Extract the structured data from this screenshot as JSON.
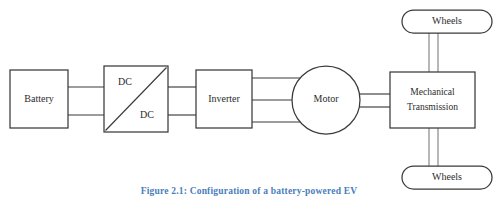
{
  "figure": {
    "caption": "Figure 2.1: Configuration of a battery-powered EV",
    "caption_color": "#4a7ebb",
    "background_color": "#ffffff",
    "stroke_color": "#3a3a3a",
    "shaft_color": "#7d7d84"
  },
  "nodes": {
    "battery": {
      "label": "Battery",
      "shape": "rectangle"
    },
    "dcdc": {
      "label_top": "DC",
      "label_bottom": "DC",
      "shape": "rectangle-with-diagonal"
    },
    "inverter": {
      "label": "Inverter",
      "shape": "rectangle"
    },
    "motor": {
      "label": "Motor",
      "shape": "circle"
    },
    "transmission": {
      "label_line1": "Mechanical",
      "label_line2": "Transmission",
      "shape": "rectangle"
    },
    "wheels_top": {
      "label": "Wheels",
      "shape": "stadium"
    },
    "wheels_bottom": {
      "label": "Wheels",
      "shape": "stadium"
    }
  },
  "connections": [
    {
      "from": "battery",
      "to": "dcdc",
      "lines": 2,
      "kind": "dc-bus"
    },
    {
      "from": "dcdc",
      "to": "inverter",
      "lines": 2,
      "kind": "dc-bus"
    },
    {
      "from": "inverter",
      "to": "motor",
      "lines": 3,
      "kind": "three-phase-ac"
    },
    {
      "from": "motor",
      "to": "transmission",
      "lines": 2,
      "kind": "shaft"
    },
    {
      "from": "transmission",
      "to": "wheels_top",
      "lines": 2,
      "kind": "axle"
    },
    {
      "from": "transmission",
      "to": "wheels_bottom",
      "lines": 2,
      "kind": "axle"
    }
  ]
}
